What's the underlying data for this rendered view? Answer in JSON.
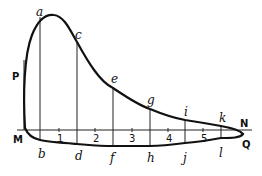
{
  "diagram": {
    "title": "",
    "type": "indicator-diagram",
    "ink_color": "#111111",
    "background": "#ffffff",
    "point_labels": {
      "top": [
        "a",
        "c",
        "e",
        "g",
        "i",
        "k"
      ],
      "bottom": [
        "b",
        "d",
        "f",
        "h",
        "j",
        "l"
      ],
      "P": "P",
      "M": "M",
      "N": "N",
      "Q": "Q"
    },
    "axis_numbers": [
      "1",
      "2",
      "3",
      "4",
      "5"
    ]
  }
}
